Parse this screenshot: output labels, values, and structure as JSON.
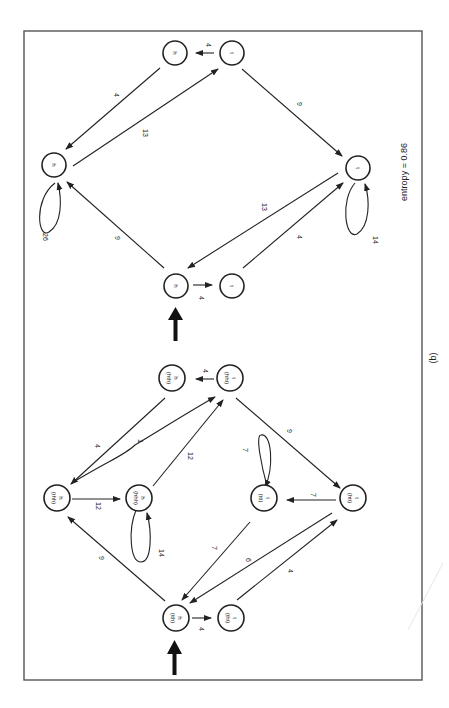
{
  "figure": {
    "caption": "(b)",
    "entropy_label": "entropy = 0.86"
  },
  "top_graph": {
    "nodes": {
      "start_h": "h",
      "start_t": "t",
      "h_main": "h",
      "t_main": "t",
      "h_top": "h",
      "t_top": "t"
    },
    "edges": {
      "start_h_to_start_t": "4",
      "start_h_to_h_main": "9",
      "t_main_to_start_h": "13",
      "start_t_to_t_main": "4",
      "h_main_self": "26",
      "t_main_self": "14",
      "h_top_to_h_main": "4",
      "h_main_to_t_top": "13",
      "t_top_to_h_top": "4",
      "t_top_to_t_main": "9"
    }
  },
  "bottom_graph": {
    "nodes": {
      "tth": {
        "symbol": "h",
        "context": "(tth)"
      },
      "tht": {
        "symbol": "t",
        "context": "(tht)"
      },
      "thh": {
        "symbol": "h",
        "context": "(thh)"
      },
      "hhh": {
        "symbol": "h",
        "context": "(hhh)"
      },
      "ttt": {
        "symbol": "t",
        "context": "(ttt)"
      },
      "htt": {
        "symbol": "t",
        "context": "(htt)"
      },
      "hth": {
        "symbol": "h",
        "context": "(hth)"
      },
      "hht": {
        "symbol": "t",
        "context": "(hht)"
      }
    },
    "edges": {
      "tth_to_tht": "4",
      "tth_to_thh": "9",
      "ttt_to_tth": "7",
      "htt_to_tth": "6",
      "tht_to_htt": "4",
      "thh_to_hhh": "12",
      "hhh_self": "14",
      "ttt_self": "7",
      "htt_to_ttt": "7",
      "hth_to_thh": "4",
      "thh_to_hht": "1",
      "hhh_to_hht": "12",
      "hht_to_hth": "4",
      "hht_to_htt": "9"
    }
  }
}
